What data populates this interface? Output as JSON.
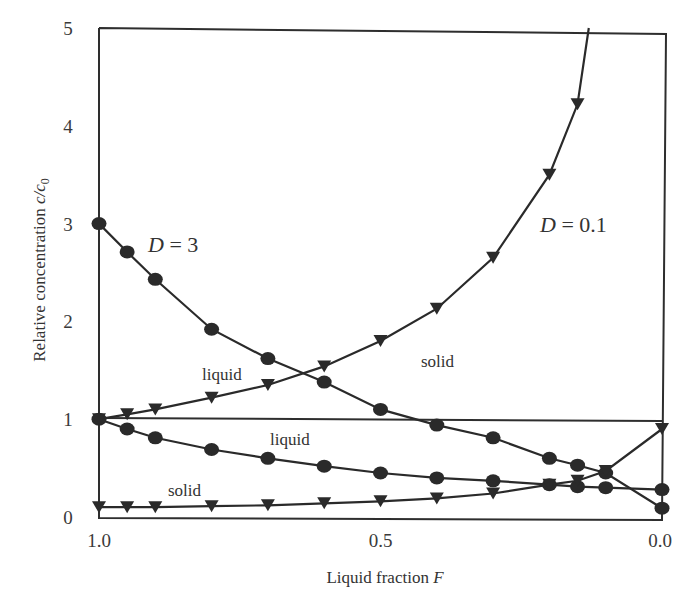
{
  "chart_data": {
    "type": "line",
    "title": "",
    "xlabel": "Liquid fraction F",
    "xlabel_text": "Liquid fraction ",
    "xlabel_var": "F",
    "ylabel": "Relative concentration c/c0",
    "ylabel_text": "Relative concentration ",
    "ylabel_var": "c/c",
    "ylabel_sub": "0",
    "xlim": [
      1.0,
      0.0
    ],
    "ylim": [
      0,
      5
    ],
    "x_reversed": true,
    "grid": false,
    "x_ticks": [
      "1.0",
      "0.5",
      "0.0"
    ],
    "x_tick_values": [
      1.0,
      0.5,
      0.0
    ],
    "y_ticks": [
      "0",
      "1",
      "2",
      "3",
      "4",
      "5"
    ],
    "y_tick_values": [
      0,
      1,
      2,
      3,
      4,
      5
    ],
    "reference_line": {
      "y": 1,
      "label": ""
    },
    "series": [
      {
        "name": "D = 3, solid",
        "marker": "circle",
        "x": [
          1.0,
          0.95,
          0.9,
          0.8,
          0.7,
          0.6,
          0.5,
          0.4,
          0.3,
          0.2,
          0.15,
          0.1,
          0.0
        ],
        "values": [
          3.0,
          2.71,
          2.43,
          1.92,
          1.62,
          1.38,
          1.1,
          0.94,
          0.81,
          0.6,
          0.53,
          0.45,
          0.09
        ]
      },
      {
        "name": "D = 3, liquid",
        "marker": "circle",
        "x": [
          1.0,
          0.95,
          0.9,
          0.8,
          0.7,
          0.6,
          0.5,
          0.4,
          0.3,
          0.2,
          0.15,
          0.1,
          0.0
        ],
        "values": [
          1.0,
          0.9,
          0.81,
          0.69,
          0.6,
          0.52,
          0.45,
          0.4,
          0.37,
          0.33,
          0.31,
          0.3,
          0.28
        ]
      },
      {
        "name": "D = 0.1, liquid",
        "marker": "triangle-down",
        "x": [
          1.0,
          0.95,
          0.9,
          0.8,
          0.7,
          0.6,
          0.5,
          0.4,
          0.3,
          0.2,
          0.15,
          0.13
        ],
        "values": [
          1.0,
          1.05,
          1.1,
          1.22,
          1.35,
          1.54,
          1.8,
          2.13,
          2.65,
          3.5,
          4.22,
          5.0
        ]
      },
      {
        "name": "D = 0.1, solid",
        "marker": "triangle-down",
        "x": [
          1.0,
          0.95,
          0.9,
          0.8,
          0.7,
          0.6,
          0.5,
          0.4,
          0.3,
          0.2,
          0.15,
          0.1,
          0.0
        ],
        "values": [
          0.1,
          0.1,
          0.1,
          0.11,
          0.12,
          0.14,
          0.16,
          0.19,
          0.24,
          0.33,
          0.37,
          0.47,
          0.9
        ]
      }
    ],
    "annotations": [
      {
        "text": "D = 3",
        "x": 0.9,
        "y": 2.75
      },
      {
        "text": "D = 0.1",
        "x": 0.2,
        "y": 2.9
      },
      {
        "text": "liquid",
        "x": 0.78,
        "y": 1.4,
        "series": "D = 0.1, liquid"
      },
      {
        "text": "solid",
        "x": 0.38,
        "y": 1.55,
        "series": "D = 3, solid"
      },
      {
        "text": "liquid",
        "x": 0.58,
        "y": 0.8,
        "series": "D = 3, liquid"
      },
      {
        "text": "solid",
        "x": 0.83,
        "y": 0.2,
        "series": "D = 0.1, solid"
      }
    ],
    "legend": "none (inline labels)"
  },
  "labels": {
    "d3": "D = 3",
    "d3_var": "D",
    "d3_eq": " = 3",
    "d01_var": "D",
    "d01_eq": " = 0.1",
    "liquid_upper": "liquid",
    "solid_upper": "solid",
    "liquid_lower": "liquid",
    "solid_lower": "solid"
  }
}
